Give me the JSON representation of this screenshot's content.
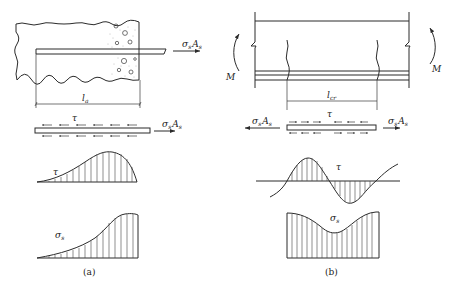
{
  "figure": {
    "panels": [
      {
        "id": "a",
        "caption": "(a)",
        "force_label": {
          "main": "σ",
          "sub1": "s",
          "main2": "A",
          "sub2": "s"
        },
        "length_label": {
          "main": "l",
          "sub": "a"
        },
        "tau_label": "τ",
        "sigma_label": {
          "main": "σ",
          "sub": "s"
        }
      },
      {
        "id": "b",
        "caption": "(b)",
        "moment_label": "M",
        "force_label": {
          "main": "σ",
          "sub1": "s",
          "main2": "A",
          "sub2": "s"
        },
        "length_label": {
          "main": "l",
          "sub": "cr"
        },
        "tau_label": "τ",
        "sigma_label": {
          "main": "σ",
          "sub": "s"
        }
      }
    ]
  },
  "colors": {
    "line": "#2b2b2b",
    "background": "#ffffff"
  }
}
